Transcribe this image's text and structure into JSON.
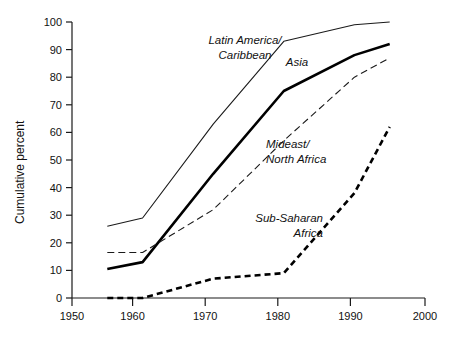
{
  "chart_data": {
    "type": "line",
    "title": "",
    "xlabel": "",
    "ylabel": "Cumulative percent",
    "xlim": [
      1950,
      2000
    ],
    "ylim": [
      0,
      100
    ],
    "xticks": [
      1950,
      1960,
      1970,
      1980,
      1990,
      2000
    ],
    "yticks": [
      0,
      10,
      20,
      30,
      40,
      50,
      60,
      70,
      80,
      90,
      100
    ],
    "grid": false,
    "legend_position": "inline-annotations",
    "x": [
      1955,
      1960,
      1970,
      1980,
      1990,
      1995
    ],
    "series": [
      {
        "name": "Latin America/\nCaribbean",
        "label_line1": "Latin America/",
        "label_line2": "Caribbean",
        "style": "thin-solid",
        "color": "#1a1a1a",
        "values": [
          26,
          29,
          63,
          93,
          99,
          100
        ]
      },
      {
        "name": "Asia",
        "label_line1": "Asia",
        "label_line2": "",
        "style": "thick-solid",
        "color": "#000000",
        "values": [
          10.5,
          13,
          45,
          75,
          88,
          92
        ]
      },
      {
        "name": "Mideast/\nNorth Africa",
        "label_line1": "Mideast/",
        "label_line2": "North Africa",
        "style": "fine-dashed",
        "color": "#1a1a1a",
        "values": [
          16.5,
          16.5,
          32,
          57,
          80,
          87
        ]
      },
      {
        "name": "Sub-Saharan\nAfrica",
        "label_line1": "Sub-Saharan",
        "label_line2": "Africa",
        "style": "bold-dashed",
        "color": "#000000",
        "values": [
          0,
          0,
          7,
          9,
          38,
          62
        ]
      }
    ]
  },
  "axis": {
    "y_title": "Cumulative percent",
    "x_tick_labels": [
      "1950",
      "1960",
      "1970",
      "1980",
      "1990",
      "2000"
    ],
    "y_tick_labels": [
      "0",
      "10",
      "20",
      "30",
      "40",
      "50",
      "60",
      "70",
      "80",
      "90",
      "100"
    ]
  },
  "annotations": {
    "latin_america_l1": "Latin America/",
    "latin_america_l2": "Caribbean",
    "asia": "Asia",
    "mideast_l1": "Mideast/",
    "mideast_l2": "North Africa",
    "subsaharan_l1": "Sub-Saharan",
    "subsaharan_l2": "Africa"
  }
}
